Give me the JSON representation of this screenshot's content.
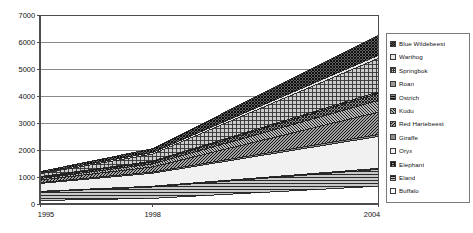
{
  "chart_data": {
    "type": "area",
    "stacked": true,
    "title": "",
    "subtitle": "",
    "xlabel": "",
    "ylabel": "",
    "x": [
      1995,
      1998,
      2004
    ],
    "xtick_labels": [
      "1995",
      "1998",
      "2004"
    ],
    "ytick_labels": [
      "0",
      "1000",
      "2000",
      "3000",
      "4000",
      "5000",
      "6000",
      "7000"
    ],
    "yticks": [
      0,
      1000,
      2000,
      3000,
      4000,
      5000,
      6000,
      7000
    ],
    "ylim": [
      0,
      7000
    ],
    "xlim": [
      1995,
      2004
    ],
    "grid": "horizontal",
    "legend_position": "right",
    "series": [
      {
        "name": "Buffalo",
        "values": [
          130,
          210,
          660
        ],
        "swatch": "sw-white"
      },
      {
        "name": "Eland",
        "values": [
          320,
          420,
          620
        ],
        "swatch": "sw-hlines"
      },
      {
        "name": "Elephant",
        "values": [
          20,
          30,
          40
        ],
        "swatch": "sw-brick"
      },
      {
        "name": "Oryx",
        "values": [
          290,
          480,
          1180
        ],
        "swatch": "sw-verylight"
      },
      {
        "name": "Giraffe",
        "values": [
          30,
          45,
          70
        ],
        "swatch": "sw-mid"
      },
      {
        "name": "Red Hartebeest",
        "values": [
          95,
          190,
          830
        ],
        "swatch": "sw-diag2"
      },
      {
        "name": "Kudu",
        "values": [
          60,
          110,
          430
        ],
        "swatch": "sw-diag"
      },
      {
        "name": "Ostrich",
        "values": [
          40,
          70,
          260
        ],
        "swatch": "sw-crosshatch"
      },
      {
        "name": "Roan",
        "values": [
          25,
          35,
          60
        ],
        "swatch": "sw-dots-mid"
      },
      {
        "name": "Springbok",
        "values": [
          110,
          260,
          1240
        ],
        "swatch": "sw-grid"
      },
      {
        "name": "Warthog",
        "values": [
          35,
          55,
          110
        ],
        "swatch": "sw-light"
      },
      {
        "name": "Blue Wildebeest",
        "values": [
          45,
          145,
          750
        ],
        "swatch": "sw-checker-dark"
      }
    ],
    "legend_order": [
      "Blue Wildebeest",
      "Warthog",
      "Springbok",
      "Roan",
      "Ostrich",
      "Kudu",
      "Red Hartebeest",
      "Giraffe",
      "Oryx",
      "Elephant",
      "Eland",
      "Buffalo"
    ],
    "colors": {
      "axis": "#4d4d4d",
      "gridline": "#808080",
      "plot_background": "#ffffff",
      "text": "#111111",
      "legend_border": "#7a7a7a"
    }
  },
  "legend": {
    "items": [
      {
        "label": "Blue Wildebeest"
      },
      {
        "label": "Warthog"
      },
      {
        "label": "Springbok"
      },
      {
        "label": "Roan"
      },
      {
        "label": "Ostrich"
      },
      {
        "label": "Kudu"
      },
      {
        "label": "Red Hartebeest"
      },
      {
        "label": "Giraffe"
      },
      {
        "label": "Oryx"
      },
      {
        "label": "Elephant"
      },
      {
        "label": "Eland"
      },
      {
        "label": "Buffalo"
      }
    ]
  },
  "axes": {
    "y_labels": [
      "7000",
      "6000",
      "5000",
      "4000",
      "3000",
      "2000",
      "1000",
      "0"
    ],
    "x_labels": [
      "1995",
      "1998",
      "2004"
    ]
  }
}
